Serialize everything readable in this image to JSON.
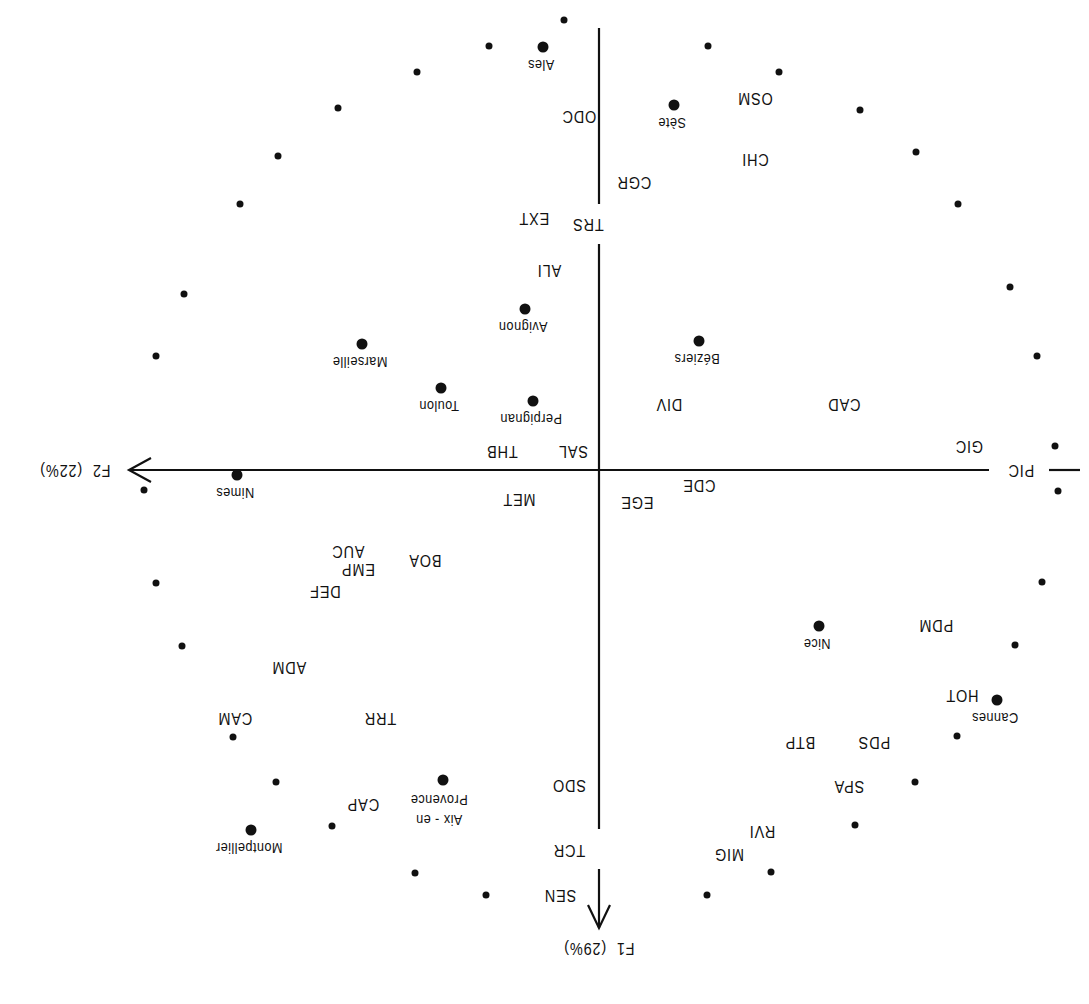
{
  "figure": {
    "orientation": "rotated-180",
    "axes": {
      "f1": {
        "label": "F1",
        "percent": "(29%)"
      },
      "f2": {
        "label": "F2",
        "percent": "(22%)"
      }
    },
    "center_labels": {
      "sal": "SAL",
      "thb": "THB"
    }
  },
  "chart_data": {
    "type": "scatter",
    "title": "",
    "xlabel": "F2 (22%)",
    "ylabel": "F1 (29%)",
    "grid": false,
    "note": "Factorial map (rotated 180° in the screenshot). Coordinates given in screen pixels of the unrotated plot (x to the right, y downward); origin at axes crossing.",
    "origin_px": [
      490,
      534
    ],
    "cities": [
      {
        "name": "Ales",
        "x": 546,
        "y": 957
      },
      {
        "name": "Sète",
        "x": 415,
        "y": 899
      },
      {
        "name": "Avignon",
        "x": 564,
        "y": 695
      },
      {
        "name": "Béziers",
        "x": 390,
        "y": 663
      },
      {
        "name": "Marseille",
        "x": 727,
        "y": 660
      },
      {
        "name": "Toulon",
        "x": 648,
        "y": 616
      },
      {
        "name": "Perpignan",
        "x": 556,
        "y": 603
      },
      {
        "name": "Nimes",
        "x": 852,
        "y": 529
      },
      {
        "name": "Nice",
        "x": 270,
        "y": 378
      },
      {
        "name": "Cannes",
        "x": 92,
        "y": 304
      },
      {
        "name": "Aix-en Provence",
        "x": 646,
        "y": 224
      },
      {
        "name": "Montpellier",
        "x": 838,
        "y": 174
      }
    ],
    "sectors": [
      {
        "code": "ODC",
        "x": 510,
        "y": 888
      },
      {
        "code": "OSM",
        "x": 334,
        "y": 906
      },
      {
        "code": "CHI",
        "x": 334,
        "y": 845
      },
      {
        "code": "CGR",
        "x": 455,
        "y": 822
      },
      {
        "code": "TRS",
        "x": 501,
        "y": 780
      },
      {
        "code": "EXT",
        "x": 555,
        "y": 786
      },
      {
        "code": "ALI",
        "x": 540,
        "y": 734
      },
      {
        "code": "DIV",
        "x": 420,
        "y": 600
      },
      {
        "code": "CAD",
        "x": 245,
        "y": 600
      },
      {
        "code": "SAL",
        "x": 516,
        "y": 553
      },
      {
        "code": "THB",
        "x": 587,
        "y": 553
      },
      {
        "code": "GIC",
        "x": 120,
        "y": 558
      },
      {
        "code": "PIC",
        "x": 68,
        "y": 534
      },
      {
        "code": "CDE",
        "x": 390,
        "y": 519
      },
      {
        "code": "EGE",
        "x": 452,
        "y": 502
      },
      {
        "code": "MET",
        "x": 570,
        "y": 505
      },
      {
        "code": "BOA",
        "x": 664,
        "y": 444
      },
      {
        "code": "EMP",
        "x": 731,
        "y": 435
      },
      {
        "code": "AUC",
        "x": 741,
        "y": 453
      },
      {
        "code": "DEF",
        "x": 764,
        "y": 413
      },
      {
        "code": "PDM",
        "x": 153,
        "y": 379
      },
      {
        "code": "ADM",
        "x": 800,
        "y": 337
      },
      {
        "code": "HOT",
        "x": 127,
        "y": 309
      },
      {
        "code": "TRR",
        "x": 709,
        "y": 286
      },
      {
        "code": "CAM",
        "x": 854,
        "y": 286
      },
      {
        "code": "PDS",
        "x": 215,
        "y": 262
      },
      {
        "code": "BTP",
        "x": 289,
        "y": 262
      },
      {
        "code": "SDO",
        "x": 520,
        "y": 219
      },
      {
        "code": "SPA",
        "x": 240,
        "y": 218
      },
      {
        "code": "CAP",
        "x": 726,
        "y": 200
      },
      {
        "code": "RVI",
        "x": 327,
        "y": 173
      },
      {
        "code": "MIG",
        "x": 360,
        "y": 150
      },
      {
        "code": "TCR",
        "x": 520,
        "y": 154
      },
      {
        "code": "SEN",
        "x": 529,
        "y": 109
      }
    ],
    "unit_circle_points": [
      [
        525,
        984
      ],
      [
        600,
        958
      ],
      [
        672,
        932
      ],
      [
        751,
        896
      ],
      [
        811,
        848
      ],
      [
        849,
        800
      ],
      [
        905,
        710
      ],
      [
        933,
        648
      ],
      [
        945,
        514
      ],
      [
        933,
        421
      ],
      [
        907,
        358
      ],
      [
        856,
        267
      ],
      [
        813,
        222
      ],
      [
        757,
        178
      ],
      [
        674,
        131
      ],
      [
        603,
        109
      ],
      [
        381,
        958
      ],
      [
        310,
        932
      ],
      [
        229,
        894
      ],
      [
        173,
        852
      ],
      [
        131,
        800
      ],
      [
        79,
        717
      ],
      [
        52,
        648
      ],
      [
        34,
        558
      ],
      [
        31,
        513
      ],
      [
        47,
        422
      ],
      [
        74,
        359
      ],
      [
        132,
        268
      ],
      [
        174,
        222
      ],
      [
        234,
        179
      ],
      [
        318,
        132
      ],
      [
        382,
        109
      ]
    ]
  }
}
